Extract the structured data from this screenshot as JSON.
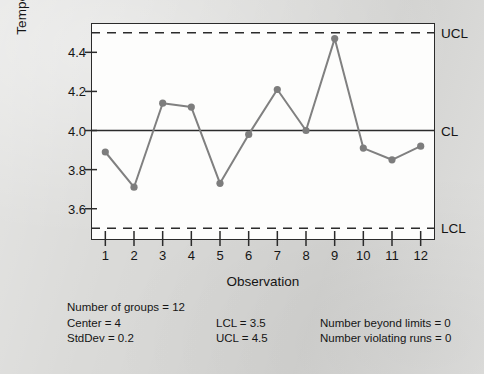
{
  "chart_data": {
    "type": "line",
    "title": "",
    "xlabel": "Observation",
    "ylabel": "Temperature Loss",
    "x": [
      1,
      2,
      3,
      4,
      5,
      6,
      7,
      8,
      9,
      10,
      11,
      12
    ],
    "values": [
      3.89,
      3.71,
      4.14,
      4.12,
      3.73,
      3.98,
      4.21,
      4.0,
      4.47,
      3.91,
      3.85,
      3.92
    ],
    "series": [
      {
        "name": "Temperature Loss",
        "values": [
          3.89,
          3.71,
          4.14,
          4.12,
          3.73,
          3.98,
          4.21,
          4.0,
          4.47,
          3.91,
          3.85,
          3.92
        ]
      }
    ],
    "xtick_labels": [
      "1",
      "2",
      "3",
      "4",
      "5",
      "6",
      "7",
      "8",
      "9",
      "10",
      "11",
      "12"
    ],
    "ytick_labels": [
      "4.4",
      "4.2",
      "4.0",
      "3.8",
      "3.6"
    ],
    "ytick_values": [
      4.4,
      4.2,
      4.0,
      3.8,
      3.6
    ],
    "xlim": [
      0.5,
      12.5
    ],
    "ylim": [
      3.44,
      4.55
    ],
    "grid": false,
    "legend": "none",
    "control_lines": [
      {
        "key": "ucl",
        "label": "UCL",
        "value": 4.5,
        "style": "dashed"
      },
      {
        "key": "cl",
        "label": "CL",
        "value": 4.0,
        "style": "solid"
      },
      {
        "key": "lcl",
        "label": "LCL",
        "value": 3.5,
        "style": "dashed"
      }
    ],
    "colors": {
      "series": "#808080",
      "marker": "#7d7d7d",
      "axis": "#2b2b2b",
      "control_line": "#2b2b2b",
      "plot_background": "#fdfdfc",
      "page_background": "#d9d9d7"
    }
  },
  "statistics": {
    "number_of_groups": "Number of groups = 12",
    "center": "Center = 4",
    "stddev": "StdDev = 0.2",
    "lcl": "LCL = 3.5",
    "ucl": "UCL = 4.5",
    "number_beyond_limits": "Number beyond limits = 0",
    "number_violating_runs": "Number violating runs = 0"
  }
}
